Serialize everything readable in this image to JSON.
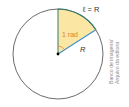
{
  "diagram": {
    "labels": {
      "arc": "ℓ = R",
      "sector": "1 rad",
      "radius": "R"
    },
    "credit": {
      "line1": "Banco de imagens/",
      "line2": "Arquivo da editora"
    },
    "colors": {
      "circle": "#5a5a5a",
      "sector_fill": "#fbe7a3",
      "radius_vertical": "#2e7d6e",
      "radius_oblique": "#3a8fd0",
      "arc": "#2e7d6e",
      "sector_text": "#d9822b",
      "angle_mark": "#d9822b",
      "center": "#000000"
    },
    "geometry": {
      "center": [
        58,
        54
      ],
      "radius": 45,
      "angle_deg": 57.3
    }
  }
}
